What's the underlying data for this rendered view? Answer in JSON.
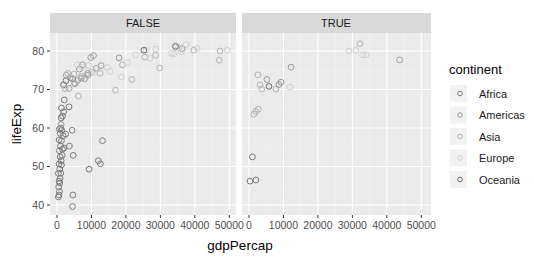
{
  "chart_data": {
    "type": "scatter",
    "title": "",
    "xlabel": "gdpPercap",
    "ylabel": "lifeExp",
    "facets": [
      "FALSE",
      "TRUE"
    ],
    "xlim": [
      0,
      50000
    ],
    "ylim": [
      38,
      85
    ],
    "x_ticks": [
      0,
      10000,
      20000,
      30000,
      40000,
      50000
    ],
    "x_tick_labels": [
      "0",
      "10000",
      "20000",
      "30000",
      "40000",
      "50000"
    ],
    "y_ticks": [
      40,
      50,
      60,
      70,
      80
    ],
    "y_tick_labels": [
      "40",
      "50",
      "60",
      "70",
      "80"
    ],
    "grid": true,
    "legend": {
      "title": "continent",
      "position": "right",
      "entries": [
        {
          "label": "Africa",
          "color": "#7a7a7a"
        },
        {
          "label": "Americas",
          "color": "#9a9a9a"
        },
        {
          "label": "Asia",
          "color": "#b2b2b2"
        },
        {
          "label": "Europe",
          "color": "#cfcfcf"
        },
        {
          "label": "Oceania",
          "color": "#6a6a6a"
        }
      ]
    },
    "series": [
      {
        "facet": "FALSE",
        "points": [
          {
            "x": 400,
            "y": 42.1,
            "c": "Africa"
          },
          {
            "x": 600,
            "y": 42.6,
            "c": "Africa"
          },
          {
            "x": 700,
            "y": 43.5,
            "c": "Africa"
          },
          {
            "x": 500,
            "y": 44.7,
            "c": "Africa"
          },
          {
            "x": 800,
            "y": 45.7,
            "c": "Africa"
          },
          {
            "x": 600,
            "y": 46.2,
            "c": "Africa"
          },
          {
            "x": 900,
            "y": 46.9,
            "c": "Africa"
          },
          {
            "x": 400,
            "y": 48.2,
            "c": "Africa"
          },
          {
            "x": 1100,
            "y": 48.3,
            "c": "Africa"
          },
          {
            "x": 800,
            "y": 49.3,
            "c": "Africa"
          },
          {
            "x": 1300,
            "y": 50.4,
            "c": "Africa"
          },
          {
            "x": 600,
            "y": 50.7,
            "c": "Africa"
          },
          {
            "x": 1200,
            "y": 51.5,
            "c": "Africa"
          },
          {
            "x": 900,
            "y": 52.5,
            "c": "Africa"
          },
          {
            "x": 1500,
            "y": 52.9,
            "c": "Africa"
          },
          {
            "x": 700,
            "y": 54.1,
            "c": "Africa"
          },
          {
            "x": 1600,
            "y": 54.5,
            "c": "Africa"
          },
          {
            "x": 1000,
            "y": 55.3,
            "c": "Africa"
          },
          {
            "x": 2000,
            "y": 54.8,
            "c": "Africa"
          },
          {
            "x": 1300,
            "y": 56.7,
            "c": "Africa"
          },
          {
            "x": 600,
            "y": 56.9,
            "c": "Africa"
          },
          {
            "x": 1800,
            "y": 58.0,
            "c": "Africa"
          },
          {
            "x": 900,
            "y": 58.6,
            "c": "Africa"
          },
          {
            "x": 1400,
            "y": 59.4,
            "c": "Africa"
          },
          {
            "x": 700,
            "y": 59.7,
            "c": "Africa"
          },
          {
            "x": 2500,
            "y": 58.4,
            "c": "Africa"
          },
          {
            "x": 1100,
            "y": 60.0,
            "c": "Africa"
          },
          {
            "x": 1200,
            "y": 62.6,
            "c": "Africa"
          },
          {
            "x": 1600,
            "y": 63.1,
            "c": "Africa"
          },
          {
            "x": 1900,
            "y": 64.2,
            "c": "Africa"
          },
          {
            "x": 1300,
            "y": 65.2,
            "c": "Africa"
          },
          {
            "x": 2100,
            "y": 67.3,
            "c": "Africa"
          },
          {
            "x": 3500,
            "y": 65.5,
            "c": "Africa"
          },
          {
            "x": 4600,
            "y": 42.6,
            "c": "Africa"
          },
          {
            "x": 4500,
            "y": 39.6,
            "c": "Africa"
          },
          {
            "x": 4700,
            "y": 52.9,
            "c": "Africa"
          },
          {
            "x": 3600,
            "y": 55.3,
            "c": "Africa"
          },
          {
            "x": 4400,
            "y": 59.4,
            "c": "Africa"
          },
          {
            "x": 9300,
            "y": 49.3,
            "c": "Africa"
          },
          {
            "x": 12000,
            "y": 51.5,
            "c": "Africa"
          },
          {
            "x": 12600,
            "y": 50.7,
            "c": "Africa"
          },
          {
            "x": 13200,
            "y": 56.7,
            "c": "Africa"
          },
          {
            "x": 1900,
            "y": 71.2,
            "c": "Africa"
          },
          {
            "x": 2600,
            "y": 72.3,
            "c": "Africa"
          },
          {
            "x": 4500,
            "y": 72.8,
            "c": "Africa"
          },
          {
            "x": 3800,
            "y": 73.0,
            "c": "Americas"
          },
          {
            "x": 2700,
            "y": 73.7,
            "c": "Americas"
          },
          {
            "x": 6000,
            "y": 72.4,
            "c": "Americas"
          },
          {
            "x": 7000,
            "y": 72.9,
            "c": "Americas"
          },
          {
            "x": 5200,
            "y": 71.5,
            "c": "Americas"
          },
          {
            "x": 8000,
            "y": 72.8,
            "c": "Americas"
          },
          {
            "x": 9000,
            "y": 73.7,
            "c": "Americas"
          },
          {
            "x": 6500,
            "y": 75.3,
            "c": "Americas"
          },
          {
            "x": 7400,
            "y": 76.4,
            "c": "Americas"
          },
          {
            "x": 9800,
            "y": 78.3,
            "c": "Americas"
          },
          {
            "x": 10600,
            "y": 78.8,
            "c": "Americas"
          },
          {
            "x": 12800,
            "y": 76.2,
            "c": "Americas"
          },
          {
            "x": 8900,
            "y": 74.2,
            "c": "Americas"
          },
          {
            "x": 11400,
            "y": 75.5,
            "c": "Americas"
          },
          {
            "x": 3500,
            "y": 70.3,
            "c": "Americas"
          },
          {
            "x": 1200,
            "y": 60.9,
            "c": "Americas"
          },
          {
            "x": 18000,
            "y": 78.2,
            "c": "Americas"
          },
          {
            "x": 36300,
            "y": 80.6,
            "c": "Americas"
          },
          {
            "x": 2400,
            "y": 70.2,
            "c": "Asia"
          },
          {
            "x": 3100,
            "y": 74.2,
            "c": "Asia"
          },
          {
            "x": 4900,
            "y": 74.0,
            "c": "Asia"
          },
          {
            "x": 5000,
            "y": 71.7,
            "c": "Asia"
          },
          {
            "x": 7000,
            "y": 73.4,
            "c": "Asia"
          },
          {
            "x": 10000,
            "y": 74.5,
            "c": "Asia"
          },
          {
            "x": 12500,
            "y": 74.2,
            "c": "Asia"
          },
          {
            "x": 19000,
            "y": 76.4,
            "c": "Asia"
          },
          {
            "x": 21700,
            "y": 72.6,
            "c": "Asia"
          },
          {
            "x": 29800,
            "y": 75.6,
            "c": "Asia"
          },
          {
            "x": 25500,
            "y": 78.4,
            "c": "Asia"
          },
          {
            "x": 28600,
            "y": 78.9,
            "c": "Asia"
          },
          {
            "x": 39700,
            "y": 80.2,
            "c": "Asia"
          },
          {
            "x": 47300,
            "y": 80.0,
            "c": "Asia"
          },
          {
            "x": 47100,
            "y": 77.6,
            "c": "Asia"
          },
          {
            "x": 17000,
            "y": 69.8,
            "c": "Asia"
          },
          {
            "x": 6200,
            "y": 68.3,
            "c": "Asia"
          },
          {
            "x": 5900,
            "y": 76.4,
            "c": "Europe"
          },
          {
            "x": 7400,
            "y": 75.7,
            "c": "Europe"
          },
          {
            "x": 9200,
            "y": 76.2,
            "c": "Europe"
          },
          {
            "x": 10800,
            "y": 74.5,
            "c": "Europe"
          },
          {
            "x": 14600,
            "y": 75.7,
            "c": "Europe"
          },
          {
            "x": 15400,
            "y": 74.7,
            "c": "Europe"
          },
          {
            "x": 18700,
            "y": 73.3,
            "c": "Europe"
          },
          {
            "x": 20500,
            "y": 77.0,
            "c": "Europe"
          },
          {
            "x": 22800,
            "y": 79.0,
            "c": "Europe"
          },
          {
            "x": 27000,
            "y": 78.1,
            "c": "Europe"
          },
          {
            "x": 25800,
            "y": 80.2,
            "c": "Europe"
          },
          {
            "x": 28700,
            "y": 80.5,
            "c": "Europe"
          },
          {
            "x": 33200,
            "y": 79.4,
            "c": "Europe"
          },
          {
            "x": 36100,
            "y": 79.8,
            "c": "Europe"
          },
          {
            "x": 37500,
            "y": 81.7,
            "c": "Europe"
          },
          {
            "x": 40700,
            "y": 80.7,
            "c": "Europe"
          },
          {
            "x": 49400,
            "y": 80.2,
            "c": "Europe"
          },
          {
            "x": 34400,
            "y": 81.0,
            "c": "Europe"
          },
          {
            "x": 35300,
            "y": 80.9,
            "c": "Europe"
          },
          {
            "x": 33900,
            "y": 79.3,
            "c": "Europe"
          },
          {
            "x": 25200,
            "y": 80.2,
            "c": "Oceania"
          },
          {
            "x": 34400,
            "y": 81.2,
            "c": "Oceania"
          }
        ]
      },
      {
        "facet": "TRUE",
        "points": [
          {
            "x": 300,
            "y": 46.2,
            "c": "Africa"
          },
          {
            "x": 2000,
            "y": 46.5,
            "c": "Africa"
          },
          {
            "x": 1000,
            "y": 52.5,
            "c": "Africa"
          },
          {
            "x": 1400,
            "y": 63.6,
            "c": "Asia"
          },
          {
            "x": 2000,
            "y": 64.3,
            "c": "Asia"
          },
          {
            "x": 2700,
            "y": 64.9,
            "c": "Asia"
          },
          {
            "x": 3200,
            "y": 71.2,
            "c": "Asia"
          },
          {
            "x": 3700,
            "y": 70.1,
            "c": "Asia"
          },
          {
            "x": 2600,
            "y": 73.8,
            "c": "Asia"
          },
          {
            "x": 5200,
            "y": 72.6,
            "c": "Americas"
          },
          {
            "x": 5800,
            "y": 70.8,
            "c": "Oceania"
          },
          {
            "x": 7800,
            "y": 70.1,
            "c": "Asia"
          },
          {
            "x": 8700,
            "y": 71.3,
            "c": "Americas"
          },
          {
            "x": 9300,
            "y": 71.9,
            "c": "Americas"
          },
          {
            "x": 11900,
            "y": 70.6,
            "c": "Europe"
          },
          {
            "x": 12200,
            "y": 75.8,
            "c": "Americas"
          },
          {
            "x": 29000,
            "y": 80.0,
            "c": "Europe"
          },
          {
            "x": 31000,
            "y": 80.2,
            "c": "Europe"
          },
          {
            "x": 32200,
            "y": 81.9,
            "c": "Asia"
          },
          {
            "x": 33000,
            "y": 79.0,
            "c": "Europe"
          },
          {
            "x": 34000,
            "y": 79.0,
            "c": "Europe"
          },
          {
            "x": 43700,
            "y": 77.7,
            "c": "Americas"
          }
        ]
      }
    ]
  },
  "panels": [
    {
      "strip_label": "FALSE"
    },
    {
      "strip_label": "TRUE"
    }
  ],
  "axes": {
    "x_title": "gdpPercap",
    "y_title": "lifeExp"
  }
}
